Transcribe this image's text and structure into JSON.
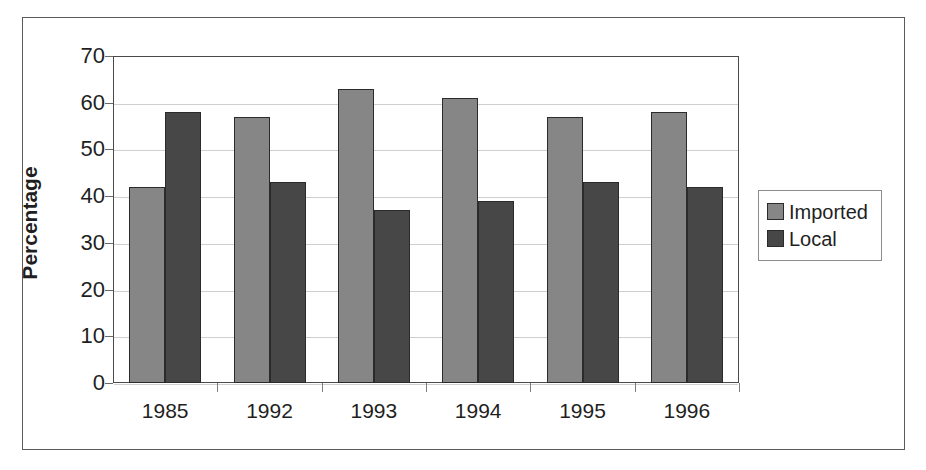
{
  "chart_data": {
    "type": "bar",
    "title": "",
    "subtitle": "",
    "xlabel": "",
    "ylabel": "Percentage",
    "categories": [
      "1985",
      "1992",
      "1993",
      "1994",
      "1995",
      "1996"
    ],
    "series": [
      {
        "name": "Imported",
        "color": "#868686",
        "values": [
          42,
          57,
          63,
          61,
          57,
          58
        ]
      },
      {
        "name": "Local",
        "color": "#474747",
        "values": [
          58,
          43,
          37,
          39,
          43,
          42
        ]
      }
    ],
    "ylim": [
      0,
      70
    ],
    "ytick_step": 10,
    "yticks": [
      70,
      60,
      50,
      40,
      30,
      20,
      10,
      0
    ],
    "grid": "horizontal",
    "legend_position": "right",
    "legend_entries": [
      "Imported",
      "Local"
    ],
    "annotations": []
  },
  "axes": {
    "y_title": "Percentage",
    "y_tick_labels": [
      "70",
      "60",
      "50",
      "40",
      "30",
      "20",
      "10",
      "0"
    ],
    "x_tick_labels": [
      "1985",
      "1992",
      "1993",
      "1994",
      "1995",
      "1996"
    ]
  },
  "legend": {
    "items": [
      {
        "label": "Imported",
        "color": "#868686"
      },
      {
        "label": "Local",
        "color": "#474747"
      }
    ]
  },
  "colors": {
    "imported": "#868686",
    "local": "#474747",
    "gridline": "#cfcfcf",
    "axis": "#4a4a4a",
    "frame": "#5a5a5a",
    "text": "#1f1f1f",
    "background": "#ffffff"
  }
}
